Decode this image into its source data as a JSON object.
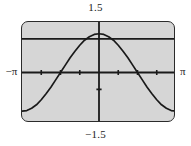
{
  "figure": {
    "name": "graphing-calculator-viewport",
    "background_color": "#d6d6d6",
    "border_color": "#2b2b2b",
    "curve_color": "#1a1a1a",
    "axis_color": "#1a1a1a"
  },
  "labels": {
    "top": "1.5",
    "bottom": "−1.5",
    "left": "−π",
    "right": "π"
  },
  "chart_data": {
    "type": "line",
    "title": "",
    "xlabel": "",
    "ylabel": "",
    "xlim": [
      -3.14159,
      3.14159
    ],
    "ylim": [
      -1.5,
      1.5
    ],
    "xtick_labels": [
      "−π",
      "π"
    ],
    "ytick_labels": [
      "1.5",
      "−1.5"
    ],
    "grid": false,
    "legend": "none",
    "x_axis_ticks": [
      -2.356,
      -1.571,
      -0.785,
      0.785,
      1.571,
      2.356
    ],
    "y_axis_ticks": [
      -0.5
    ],
    "series": [
      {
        "name": "cosine-curve",
        "x": [
          -3.14159,
          -2.94524,
          -2.74889,
          -2.55254,
          -2.35619,
          -2.15984,
          -1.9635,
          -1.76715,
          -1.5708,
          -1.37445,
          -1.1781,
          -0.98175,
          -0.7854,
          -0.58905,
          -0.3927,
          -0.19635,
          0.0,
          0.19635,
          0.3927,
          0.58905,
          0.7854,
          0.98175,
          1.1781,
          1.37445,
          1.5708,
          1.76715,
          1.9635,
          2.15984,
          2.35619,
          2.55254,
          2.74889,
          2.94524,
          3.14159
        ],
        "y": [
          -1.15,
          -1.13,
          -1.06,
          -0.96,
          -0.81,
          -0.63,
          -0.44,
          -0.22,
          0.0,
          0.22,
          0.44,
          0.63,
          0.81,
          0.96,
          1.06,
          1.13,
          1.15,
          1.13,
          1.06,
          0.96,
          0.81,
          0.63,
          0.44,
          0.22,
          0.0,
          -0.22,
          -0.44,
          -0.63,
          -0.81,
          -0.96,
          -1.06,
          -1.13,
          -1.15
        ]
      },
      {
        "name": "horizontal-reference-line",
        "y_value": 1.0,
        "x": [
          -3.14159,
          3.14159
        ],
        "y": [
          1.0,
          1.0
        ]
      }
    ]
  }
}
